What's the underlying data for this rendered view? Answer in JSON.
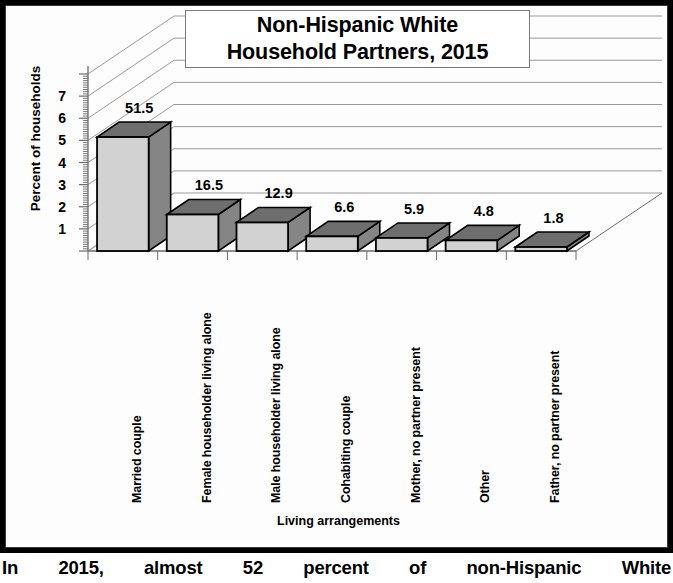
{
  "figure": {
    "title_line1": "Non-Hispanic White",
    "title_line2": "Household Partners, 2015",
    "caption": "In 2015, almost 52 percent of non-Hispanic White"
  },
  "chart_data": {
    "type": "bar",
    "subtitle": "",
    "xlabel": "Living arrangements",
    "ylabel": "Percent of households",
    "categories": [
      "Married couple",
      "Female householder living alone",
      "Male householder living alone",
      "Cohabiting couple",
      "Mother, no partner present",
      "Other",
      "Father, no partner present"
    ],
    "values": [
      51.5,
      16.5,
      12.9,
      6.6,
      5.9,
      4.8,
      1.8
    ],
    "value_labels": [
      "51.5",
      "16.5",
      "12.9",
      "6.6",
      "5.9",
      "4.8",
      "1.8"
    ],
    "ytick_labels": [
      "7",
      "6",
      "5",
      "4",
      "3",
      "2",
      "1"
    ],
    "ytick_values": [
      7,
      6,
      5,
      4,
      3,
      2,
      1
    ],
    "ytick_scale_note": "tens of percent",
    "ylim": [
      0,
      80
    ],
    "grid": true,
    "legend": "none",
    "style": "3d-bar",
    "colors": {
      "bar_front": "#d2d2d2",
      "bar_side": "#858585",
      "bar_top": "#6e6e6e",
      "bar_outline": "#000000",
      "grid": "#9a9a9a",
      "axis": "#6b6b6b",
      "background": "#fdfdfd",
      "text": "#000000"
    }
  }
}
